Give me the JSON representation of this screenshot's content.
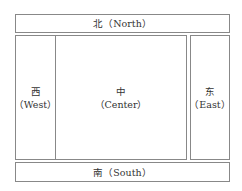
{
  "regions": {
    "north": {
      "zh": "北",
      "en": "（North）"
    },
    "west": {
      "zh": "西",
      "en": "（West）"
    },
    "center": {
      "zh": "中",
      "en": "（Center）"
    },
    "east": {
      "zh": "东",
      "en": "（East）"
    },
    "south": {
      "zh": "南",
      "en": "（South）"
    }
  }
}
